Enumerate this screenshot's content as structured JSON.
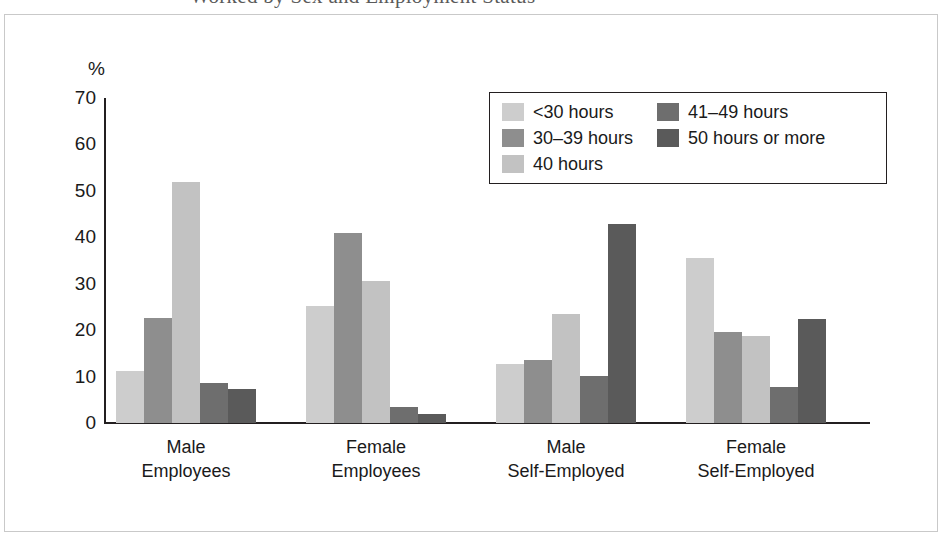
{
  "figure": {
    "title_partial": "Worked by Sex and Employment Status",
    "axis_unit_label": "%"
  },
  "chart_data": {
    "type": "bar",
    "title": "",
    "xlabel": "",
    "ylabel": "%",
    "ylim": [
      0,
      70
    ],
    "yticks": [
      0,
      10,
      20,
      30,
      40,
      50,
      60,
      70
    ],
    "grid": false,
    "legend_position": "top-right",
    "categories": [
      "Male Employees",
      "Female Employees",
      "Male Self-Employed",
      "Female Self-Employed"
    ],
    "category_lines": [
      [
        "Male",
        "Employees"
      ],
      [
        "Female",
        "Employees"
      ],
      [
        "Male",
        "Self-Employed"
      ],
      [
        "Female",
        "Self-Employed"
      ]
    ],
    "series": [
      {
        "name": "<30 hours",
        "color": "#cdcdcd",
        "values": [
          11.2,
          25.3,
          12.8,
          35.6
        ]
      },
      {
        "name": "30–39 hours",
        "color": "#8e8e8e",
        "values": [
          22.6,
          41.0,
          13.5,
          19.7
        ]
      },
      {
        "name": "40 hours",
        "color": "#c2c2c2",
        "values": [
          51.9,
          30.6,
          23.5,
          18.8
        ]
      },
      {
        "name": "41–49 hours",
        "color": "#6e6e6e",
        "values": [
          8.7,
          3.4,
          10.1,
          7.7
        ]
      },
      {
        "name": "50 hours or more",
        "color": "#5a5a5a",
        "values": [
          7.3,
          1.9,
          42.8,
          22.4
        ]
      }
    ]
  },
  "legend": {
    "columns": [
      [
        {
          "label": "<30 hours",
          "color": "#cdcdcd"
        },
        {
          "label": "30–39 hours",
          "color": "#8e8e8e"
        },
        {
          "label": "40 hours",
          "color": "#c2c2c2"
        }
      ],
      [
        {
          "label": "41–49 hours",
          "color": "#6e6e6e"
        },
        {
          "label": "50 hours or more",
          "color": "#5a5a5a"
        }
      ]
    ]
  },
  "colors": {
    "axis": "#231f20",
    "frame": "#c9c9c9",
    "text": "#1a1a1a",
    "background": "#ffffff"
  }
}
